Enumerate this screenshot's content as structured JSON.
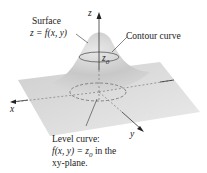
{
  "diagram": {
    "labels": {
      "surface_title": "Surface",
      "surface_eq": "z = f(x, y)",
      "contour": "Contour curve",
      "z0": "z",
      "z0_sub": "0",
      "z_axis": "z",
      "x_axis": "x",
      "y_axis": "y",
      "level_line1": "Level curve:",
      "level_line2": "f(x, y) = z",
      "level_line2_sub": "0",
      "level_line2_tail": " in the",
      "level_line3": "xy-plane."
    },
    "colors": {
      "plane": "#d9d9d9",
      "surface": "#cfcfcf",
      "lines": "#555555",
      "text": "#222222"
    }
  }
}
